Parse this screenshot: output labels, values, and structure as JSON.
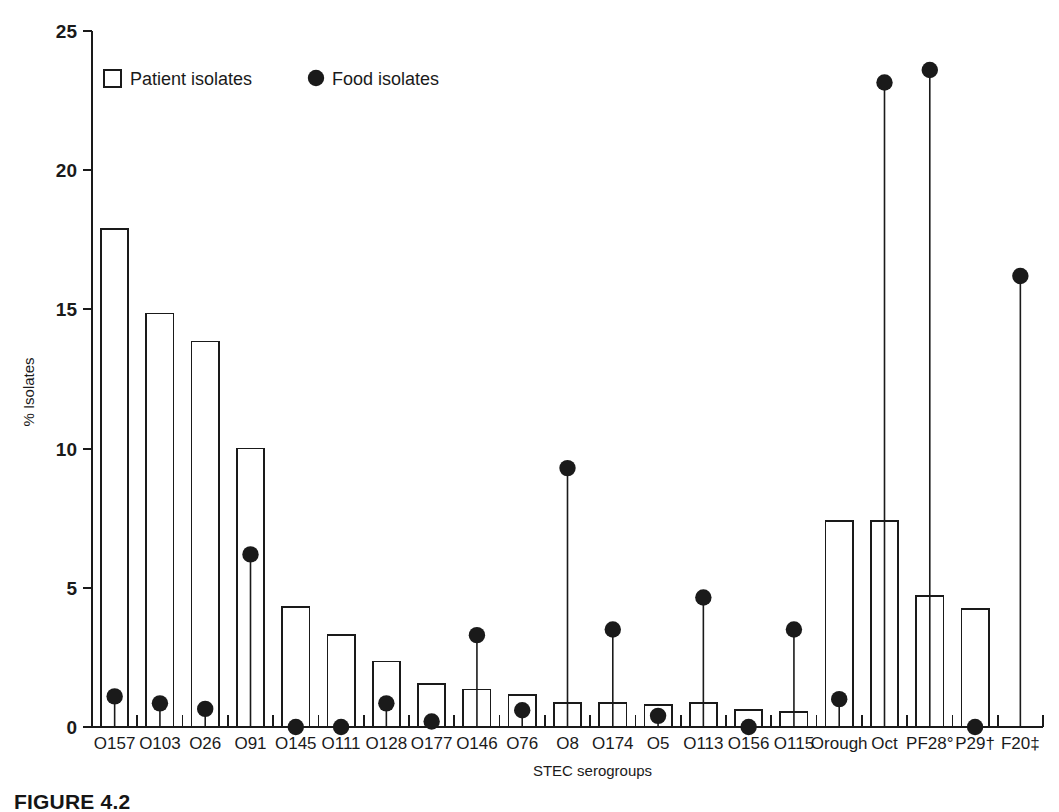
{
  "figure": {
    "caption": "FIGURE 4.2"
  },
  "legend": {
    "position": "top-left-inside",
    "entries": [
      {
        "label": "Patient isolates",
        "marker": "open-square",
        "color": "#1a1a1a"
      },
      {
        "label": "Food isolates",
        "marker": "filled-circle",
        "color": "#1a1a1a"
      }
    ]
  },
  "axes": {
    "ylabel": "% Isolates",
    "xlabel": "STEC serogroups",
    "yticks": [
      "0",
      "5",
      "10",
      "15",
      "20",
      "25"
    ],
    "ylim": [
      0,
      25
    ],
    "grid": false
  },
  "chart_data": {
    "type": "bar",
    "title": "",
    "xlabel": "STEC serogroups",
    "ylabel": "% Isolates",
    "ylim": [
      0,
      25
    ],
    "yticks": [
      0,
      5,
      10,
      15,
      20,
      25
    ],
    "grid": false,
    "legend_position": "top-left-inside",
    "categories": [
      "O157",
      "O103",
      "O26",
      "O91",
      "O145",
      "O111",
      "O128",
      "O177",
      "O146",
      "O76",
      "O8",
      "O174",
      "O5",
      "O113",
      "O156",
      "O115",
      "Orough",
      "Oct",
      "PF28°",
      "P29†",
      "F20‡"
    ],
    "series": [
      {
        "name": "Patient isolates",
        "marker": "open-square",
        "render": "bar",
        "values": [
          17.9,
          14.85,
          13.85,
          10.0,
          4.3,
          3.3,
          2.35,
          1.55,
          1.35,
          1.15,
          0.85,
          0.85,
          0.8,
          0.85,
          0.6,
          0.55,
          7.4,
          7.4,
          4.7,
          4.25,
          null
        ]
      },
      {
        "name": "Food isolates",
        "marker": "filled-circle",
        "render": "stem",
        "values": [
          1.1,
          0.85,
          0.65,
          6.2,
          0.0,
          0.0,
          0.85,
          0.2,
          3.3,
          0.6,
          9.3,
          3.5,
          0.4,
          4.65,
          0.0,
          3.5,
          1.0,
          23.15,
          23.6,
          0.0,
          16.2
        ]
      }
    ]
  }
}
